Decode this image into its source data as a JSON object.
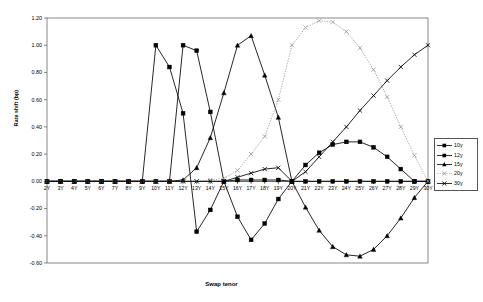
{
  "chart_data": {
    "type": "line",
    "title": "",
    "xlabel": "Swap tenor",
    "ylabel": "Rate shift (bp)",
    "ylim": [
      -0.6,
      1.2
    ],
    "ytick_step": 0.2,
    "grid": false,
    "legend_position": "right",
    "categories": [
      "2Y",
      "3Y",
      "4Y",
      "5Y",
      "6Y",
      "7Y",
      "8Y",
      "9Y",
      "10Y",
      "11Y",
      "12Y",
      "13Y",
      "14Y",
      "15Y",
      "16Y",
      "17Y",
      "18Y",
      "19Y",
      "20Y",
      "21Y",
      "22Y",
      "23Y",
      "24Y",
      "25Y",
      "26Y",
      "27Y",
      "28Y",
      "29Y",
      "30Y"
    ],
    "ytick_labels": [
      "1.20",
      "1.00",
      "0.80",
      "0.60",
      "0.40",
      "0.20",
      "0.00",
      "-0.20",
      "-0.40",
      "-0.60"
    ],
    "ytick_values": [
      1.2,
      1.0,
      0.8,
      0.6,
      0.4,
      0.2,
      0.0,
      -0.2,
      -0.4,
      -0.6
    ],
    "series": [
      {
        "name": "10y",
        "marker": "square",
        "line_style": "solid",
        "color": "#000000",
        "values": [
          0.0,
          0.0,
          0.0,
          0.0,
          0.0,
          0.0,
          0.0,
          0.0,
          1.0,
          0.84,
          0.5,
          -0.37,
          -0.21,
          0.0,
          0.01,
          0.01,
          0.01,
          0.01,
          0.0,
          0.0,
          0.0,
          0.0,
          0.0,
          0.0,
          0.0,
          0.0,
          0.0,
          0.0,
          0.0
        ]
      },
      {
        "name": "12y",
        "marker": "square",
        "line_style": "solid",
        "color": "#000000",
        "values": [
          0.0,
          0.0,
          0.0,
          0.0,
          0.0,
          0.0,
          0.0,
          0.0,
          0.0,
          0.0,
          1.0,
          0.96,
          0.51,
          0.0,
          -0.26,
          -0.43,
          -0.31,
          -0.13,
          0.0,
          0.12,
          0.21,
          0.27,
          0.29,
          0.29,
          0.25,
          0.18,
          0.09,
          0.0,
          0.0
        ]
      },
      {
        "name": "15y",
        "marker": "triangle",
        "line_style": "solid",
        "color": "#000000",
        "values": [
          0.0,
          0.0,
          0.0,
          0.0,
          0.0,
          0.0,
          0.0,
          0.0,
          0.0,
          0.0,
          0.01,
          0.1,
          0.32,
          0.65,
          1.0,
          1.07,
          0.78,
          0.47,
          0.0,
          -0.19,
          -0.36,
          -0.48,
          -0.54,
          -0.55,
          -0.5,
          -0.4,
          -0.27,
          -0.12,
          0.0
        ]
      },
      {
        "name": "20y",
        "marker": "cross",
        "line_style": "dotted",
        "color": "#999999",
        "values": [
          0.0,
          0.0,
          0.0,
          0.0,
          0.0,
          0.0,
          0.0,
          0.0,
          0.0,
          0.0,
          0.0,
          0.0,
          0.01,
          0.02,
          0.08,
          0.2,
          0.33,
          0.6,
          1.0,
          1.13,
          1.18,
          1.17,
          1.1,
          0.98,
          0.82,
          0.62,
          0.4,
          0.19,
          0.0
        ]
      },
      {
        "name": "30y",
        "marker": "cross",
        "line_style": "solid",
        "color": "#000000",
        "values": [
          0.0,
          0.0,
          0.0,
          0.0,
          0.0,
          0.0,
          0.0,
          0.0,
          0.0,
          0.0,
          0.0,
          0.0,
          0.0,
          0.0,
          0.03,
          0.06,
          0.09,
          0.1,
          0.0,
          0.07,
          0.18,
          0.29,
          0.4,
          0.52,
          0.63,
          0.74,
          0.84,
          0.93,
          1.0
        ]
      }
    ]
  },
  "legend": {
    "items": [
      {
        "label": "10y"
      },
      {
        "label": "12y"
      },
      {
        "label": "15y"
      },
      {
        "label": "20y"
      },
      {
        "label": "30y"
      }
    ]
  }
}
